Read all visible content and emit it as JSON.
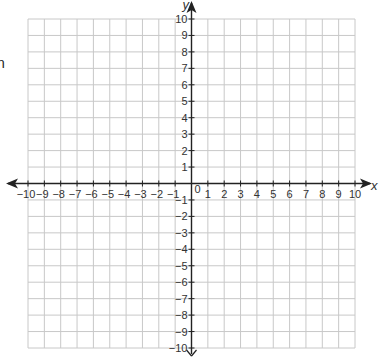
{
  "side_text": "n",
  "chart_data": {
    "type": "scatter",
    "title": "",
    "xlabel": "x",
    "ylabel": "y",
    "xlim": [
      -10,
      10
    ],
    "ylim": [
      -10,
      10
    ],
    "grid": true,
    "x_ticks": [
      -10,
      -9,
      -8,
      -7,
      -6,
      -5,
      -4,
      -3,
      -2,
      -1,
      1,
      2,
      3,
      4,
      5,
      6,
      7,
      8,
      9,
      10
    ],
    "y_ticks": [
      -10,
      -9,
      -8,
      -7,
      -6,
      -5,
      -4,
      -3,
      -2,
      -1,
      1,
      2,
      3,
      4,
      5,
      6,
      7,
      8,
      9,
      10
    ],
    "x_tick_labels": [
      "−10",
      "−9",
      "−8",
      "−7",
      "−6",
      "−5",
      "−4",
      "−3",
      "−2",
      "−1",
      "1",
      "2",
      "3",
      "4",
      "5",
      "6",
      "7",
      "8",
      "9",
      "10"
    ],
    "y_tick_labels": [
      "−10",
      "−9",
      "−8",
      "−7",
      "−6",
      "−5",
      "−4",
      "−3",
      "−2",
      "−1",
      "1",
      "2",
      "3",
      "4",
      "5",
      "6",
      "7",
      "8",
      "9",
      "10"
    ],
    "origin_label": "0",
    "points": [],
    "colors": {
      "grid": "#c8c8c8",
      "axis": "#222222",
      "text": "#333333"
    }
  }
}
